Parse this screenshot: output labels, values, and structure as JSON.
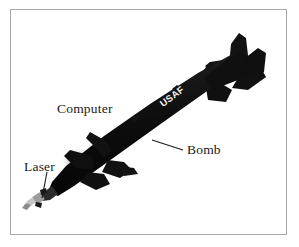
{
  "figure": {
    "kind": "labeled-photograph",
    "background_color": "#ffffff",
    "border_color": "#a8a8a8",
    "body_color": "#121212",
    "seeker_color": "#b9b9b9",
    "smudge_color": "#b0b0b0",
    "marking": {
      "text": "USAF",
      "color": "#f2f2f2",
      "rotation_deg": -37
    }
  },
  "callouts": [
    {
      "id": "computer",
      "label": "Computer",
      "leader": false
    },
    {
      "id": "bomb",
      "label": "Bomb",
      "leader": true
    },
    {
      "id": "laser",
      "label": "Laser",
      "leader": true
    }
  ],
  "leader_lines": {
    "bomb": {
      "x1": 183,
      "y1": 150,
      "x2": 152,
      "y2": 140,
      "color": "#1a1a1a"
    },
    "laser": {
      "x1": 47,
      "y1": 172,
      "x2": 42,
      "y2": 198,
      "color": "#1a1a1a"
    }
  }
}
